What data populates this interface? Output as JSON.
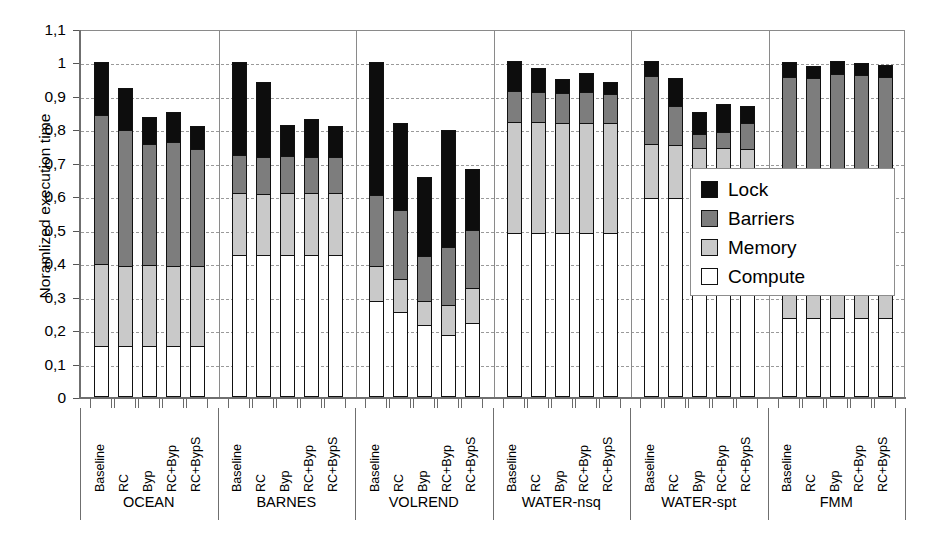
{
  "chart": {
    "type": "bar",
    "ylabel": "Noramlized execution time",
    "xlabel": ""
  },
  "yaxis": {
    "ticks": [
      "1,1",
      "1",
      "0,9",
      "0,8",
      "0,7",
      "0,6",
      "0,5",
      "0,4",
      "0,3",
      "0,2",
      "0,1",
      "0"
    ],
    "values": [
      1.1,
      1.0,
      0.9,
      0.8,
      0.7,
      0.6,
      0.5,
      0.4,
      0.3,
      0.2,
      0.1,
      0.0
    ],
    "min": 0,
    "max": 1.1
  },
  "legend": {
    "position": "right-inside",
    "items": [
      {
        "label": "Lock",
        "color": "#0d0d0d"
      },
      {
        "label": "Barriers",
        "color": "#7d7d7d"
      },
      {
        "label": "Memory",
        "color": "#c9c9c9"
      },
      {
        "label": "Compute",
        "color": "#ffffff"
      }
    ]
  },
  "chart_data": {
    "type": "bar",
    "subtype": "stacked",
    "title": "",
    "xlabel": "",
    "ylabel": "Noramlized execution time",
    "ylim": [
      0,
      1.1
    ],
    "grid": true,
    "legend_position": "right-inside",
    "group_labels": [
      "OCEAN",
      "BARNES",
      "VOLREND",
      "WATER-nsq",
      "WATER-spt",
      "FMM"
    ],
    "categories": [
      "Baseline",
      "RC",
      "Byp",
      "RC+Byp",
      "RC+BypS"
    ],
    "series": [
      {
        "name": "Compute",
        "color": "#ffffff"
      },
      {
        "name": "Memory",
        "color": "#c9c9c9"
      },
      {
        "name": "Barriers",
        "color": "#7d7d7d"
      },
      {
        "name": "Lock",
        "color": "#0d0d0d"
      }
    ],
    "groups": [
      {
        "name": "OCEAN",
        "bars": [
          {
            "label": "Baseline",
            "compute": 0.152,
            "memory": 0.245,
            "barriers": 0.447,
            "lock": 0.156,
            "total": 1.0
          },
          {
            "label": "RC",
            "compute": 0.152,
            "memory": 0.241,
            "barriers": 0.406,
            "lock": 0.126,
            "total": 0.925
          },
          {
            "label": "Byp",
            "compute": 0.152,
            "memory": 0.244,
            "barriers": 0.36,
            "lock": 0.08,
            "total": 0.836
          },
          {
            "label": "RC+Byp",
            "compute": 0.151,
            "memory": 0.24,
            "barriers": 0.371,
            "lock": 0.09,
            "total": 0.852
          },
          {
            "label": "RC+BypS",
            "compute": 0.151,
            "memory": 0.24,
            "barriers": 0.35,
            "lock": 0.069,
            "total": 0.81
          }
        ]
      },
      {
        "name": "BARNES",
        "bars": [
          {
            "label": "Baseline",
            "compute": 0.424,
            "memory": 0.187,
            "barriers": 0.112,
            "lock": 0.277,
            "total": 1.0
          },
          {
            "label": "RC",
            "compute": 0.424,
            "memory": 0.183,
            "barriers": 0.11,
            "lock": 0.225,
            "total": 0.942
          },
          {
            "label": "Byp",
            "compute": 0.424,
            "memory": 0.186,
            "barriers": 0.11,
            "lock": 0.092,
            "total": 0.812
          },
          {
            "label": "RC+Byp",
            "compute": 0.424,
            "memory": 0.186,
            "barriers": 0.108,
            "lock": 0.112,
            "total": 0.83
          },
          {
            "label": "RC+BypS",
            "compute": 0.424,
            "memory": 0.186,
            "barriers": 0.108,
            "lock": 0.092,
            "total": 0.81
          }
        ]
      },
      {
        "name": "VOLREND",
        "bars": [
          {
            "label": "Baseline",
            "compute": 0.287,
            "memory": 0.104,
            "barriers": 0.212,
            "lock": 0.397,
            "total": 1.0
          },
          {
            "label": "RC",
            "compute": 0.254,
            "memory": 0.098,
            "barriers": 0.207,
            "lock": 0.261,
            "total": 0.82
          },
          {
            "label": "Byp",
            "compute": 0.214,
            "memory": 0.072,
            "barriers": 0.136,
            "lock": 0.236,
            "total": 0.658
          },
          {
            "label": "RC+Byp",
            "compute": 0.184,
            "memory": 0.09,
            "barriers": 0.175,
            "lock": 0.348,
            "total": 0.797
          },
          {
            "label": "RC+BypS",
            "compute": 0.222,
            "memory": 0.105,
            "barriers": 0.172,
            "lock": 0.183,
            "total": 0.682
          }
        ]
      },
      {
        "name": "WATER-nsq",
        "bars": [
          {
            "label": "Baseline",
            "compute": 0.491,
            "memory": 0.33,
            "barriers": 0.094,
            "lock": 0.09,
            "total": 1.005
          },
          {
            "label": "RC",
            "compute": 0.491,
            "memory": 0.33,
            "barriers": 0.092,
            "lock": 0.072,
            "total": 0.985
          },
          {
            "label": "Byp",
            "compute": 0.491,
            "memory": 0.329,
            "barriers": 0.09,
            "lock": 0.04,
            "total": 0.95
          },
          {
            "label": "RC+Byp",
            "compute": 0.491,
            "memory": 0.329,
            "barriers": 0.091,
            "lock": 0.059,
            "total": 0.97
          },
          {
            "label": "RC+BypS",
            "compute": 0.491,
            "memory": 0.327,
            "barriers": 0.089,
            "lock": 0.035,
            "total": 0.942
          }
        ]
      },
      {
        "name": "WATER-spt",
        "bars": [
          {
            "label": "Baseline",
            "compute": 0.596,
            "memory": 0.16,
            "barriers": 0.205,
            "lock": 0.042,
            "total": 1.003
          },
          {
            "label": "RC",
            "compute": 0.596,
            "memory": 0.157,
            "barriers": 0.117,
            "lock": 0.085,
            "total": 0.955
          },
          {
            "label": "Byp",
            "compute": 0.597,
            "memory": 0.148,
            "barriers": 0.041,
            "lock": 0.065,
            "total": 0.851
          },
          {
            "label": "RC+Byp",
            "compute": 0.597,
            "memory": 0.147,
            "barriers": 0.048,
            "lock": 0.085,
            "total": 0.877
          },
          {
            "label": "RC+BypS",
            "compute": 0.597,
            "memory": 0.144,
            "barriers": 0.078,
            "lock": 0.05,
            "total": 0.869
          }
        ]
      },
      {
        "name": "FMM",
        "bars": [
          {
            "label": "Baseline",
            "compute": 0.236,
            "memory": 0.156,
            "barriers": 0.566,
            "lock": 0.042,
            "total": 1.0
          },
          {
            "label": "RC",
            "compute": 0.236,
            "memory": 0.154,
            "barriers": 0.565,
            "lock": 0.036,
            "total": 0.991
          },
          {
            "label": "Byp",
            "compute": 0.236,
            "memory": 0.154,
            "barriers": 0.577,
            "lock": 0.036,
            "total": 1.003
          },
          {
            "label": "RC+Byp",
            "compute": 0.236,
            "memory": 0.152,
            "barriers": 0.576,
            "lock": 0.036,
            "total": 1.0
          },
          {
            "label": "RC+BypS",
            "compute": 0.236,
            "memory": 0.154,
            "barriers": 0.566,
            "lock": 0.036,
            "total": 0.992
          }
        ]
      }
    ]
  }
}
